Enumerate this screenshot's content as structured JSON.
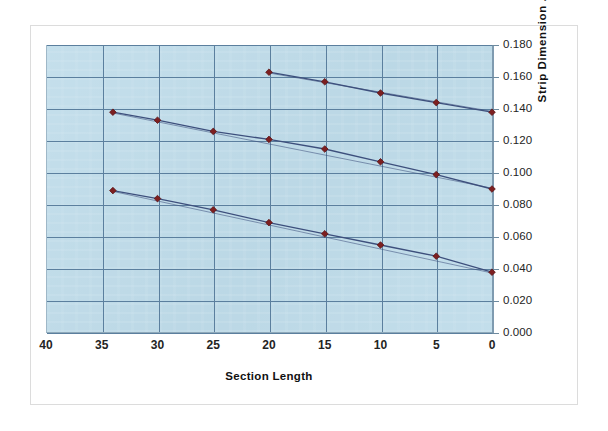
{
  "chart_data": {
    "type": "line",
    "title": "",
    "xlabel": "Section Length",
    "ylabel": "Strip Dimension .",
    "xlim": [
      40,
      0
    ],
    "ylim": [
      0.0,
      0.18
    ],
    "x_reversed": true,
    "grid": true,
    "legend": "none",
    "y_axis_position": "right",
    "x_ticks": [
      "40",
      "35",
      "30",
      "25",
      "20",
      "15",
      "10",
      "5",
      "0"
    ],
    "x_tick_values": [
      40,
      35,
      30,
      25,
      20,
      15,
      10,
      5,
      0
    ],
    "y_ticks": [
      "0.000",
      "0.020",
      "0.040",
      "0.060",
      "0.080",
      "0.100",
      "0.120",
      "0.140",
      "0.160",
      "0.180"
    ],
    "y_tick_values": [
      0.0,
      0.02,
      0.04,
      0.06,
      0.08,
      0.1,
      0.12,
      0.14,
      0.16,
      0.18
    ],
    "marker": "diamond",
    "marker_color": "#7d1f20",
    "line_color": "#3d4f7c",
    "plot_background": "#bfdcea",
    "gridline_color": "#5b7f9e",
    "series": [
      {
        "name": "series-1",
        "x": [
          20,
          15,
          10,
          5,
          0
        ],
        "values": [
          0.163,
          0.157,
          0.15,
          0.144,
          0.138
        ]
      },
      {
        "name": "series-2",
        "x": [
          34,
          30,
          25,
          20,
          15,
          10,
          5,
          0
        ],
        "values": [
          0.138,
          0.133,
          0.126,
          0.121,
          0.115,
          0.107,
          0.099,
          0.09
        ]
      },
      {
        "name": "series-3",
        "x": [
          34,
          30,
          25,
          20,
          15,
          10,
          5,
          0
        ],
        "values": [
          0.089,
          0.084,
          0.077,
          0.069,
          0.062,
          0.055,
          0.048,
          0.038
        ]
      }
    ],
    "trendlines": [
      {
        "name": "trendline-1",
        "x": [
          20,
          0
        ],
        "values": [
          0.1625,
          0.1385
        ]
      },
      {
        "name": "trendline-2",
        "x": [
          34,
          0
        ],
        "values": [
          0.1375,
          0.0905
        ]
      },
      {
        "name": "trendline-3",
        "x": [
          34,
          0
        ],
        "values": [
          0.0885,
          0.0375
        ]
      }
    ]
  }
}
